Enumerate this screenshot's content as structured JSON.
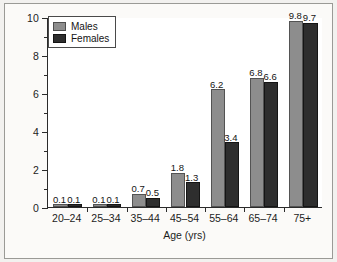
{
  "chart_data": {
    "type": "bar",
    "title": "",
    "xlabel": "Age (yrs)",
    "ylabel": "Percent of population",
    "categories": [
      "20–24",
      "25–34",
      "35–44",
      "45–54",
      "55–64",
      "65–74",
      "75+"
    ],
    "series": [
      {
        "name": "Males",
        "color": "#8d8d8d",
        "values": [
          0.1,
          0.1,
          0.7,
          1.8,
          6.2,
          6.8,
          9.8
        ],
        "labels": [
          "0.1",
          "0.1",
          "0.7",
          "1.8",
          "6.2",
          "6.8",
          "9.8"
        ]
      },
      {
        "name": "Females",
        "color": "#2e2e2e",
        "values": [
          0.1,
          0.1,
          0.5,
          1.3,
          3.4,
          6.6,
          9.7
        ],
        "labels": [
          "0.1",
          "0.1",
          "0.5",
          "1.3",
          "3.4",
          "6.6",
          "9.7"
        ]
      }
    ],
    "ylim": [
      0,
      10
    ],
    "yticks": [
      0,
      2,
      4,
      6,
      8,
      10
    ],
    "ytick_labels": [
      "0",
      "2",
      "4",
      "6",
      "8",
      "10"
    ],
    "yticks_minor": [
      1,
      3,
      5,
      7,
      9
    ],
    "grid": false,
    "legend_position": "top-left",
    "legend_entries": [
      "Males",
      "Females"
    ]
  }
}
